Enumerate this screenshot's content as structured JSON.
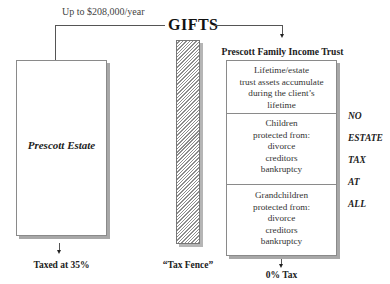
{
  "top": {
    "gift_amount": "Up to $208,000/year",
    "gifts_label": "GIFTS"
  },
  "estate": {
    "title": "Prescott Estate",
    "outcome": "Taxed at 35%"
  },
  "fence": {
    "label": "“Tax Fence”"
  },
  "trust": {
    "title": "Prescott Family Income Trust",
    "sections": [
      {
        "lines": [
          "Lifetime/estate",
          "trust assets accumulate",
          "during the client’s",
          "lifetime"
        ]
      },
      {
        "lines": [
          "Children",
          "protected from:",
          "divorce",
          "creditors",
          "bankruptcy"
        ]
      },
      {
        "lines": [
          "Grandchildren",
          "protected from:",
          "divorce",
          "creditors",
          "bankruptcy"
        ]
      }
    ],
    "outcome": "0% Tax"
  },
  "side_message": [
    "NO",
    "ESTATE",
    "TAX",
    "AT",
    "ALL"
  ]
}
